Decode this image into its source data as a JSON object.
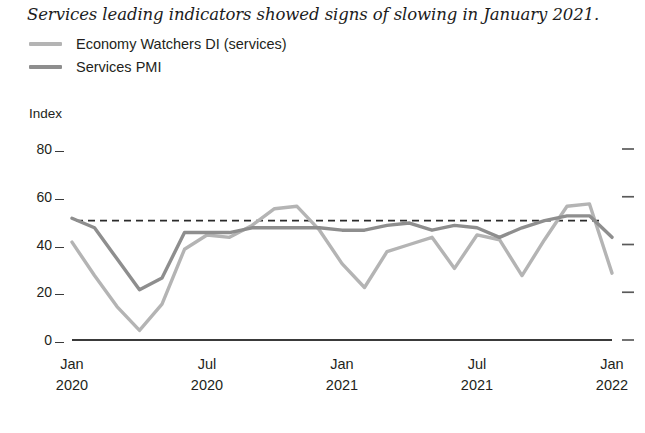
{
  "chart_title": "Services leading indicators showed signs of slowing in January 2021.",
  "axis_unit_label": "Index",
  "legend": {
    "items": [
      {
        "label": "Economy Watchers DI (services)",
        "color": "#b4b4b4",
        "series_key": "economy_watchers_di"
      },
      {
        "label": "Services PMI",
        "color": "#8e8e8e",
        "series_key": "services_pmi"
      }
    ]
  },
  "chart_data": {
    "type": "line",
    "title": "Services leading indicators showed signs of slowing in January 2021.",
    "xlabel": "",
    "ylabel": "Index",
    "ylim": [
      0,
      88
    ],
    "yticks": [
      0,
      20,
      40,
      60,
      80
    ],
    "ytick_labels": [
      "0",
      "20",
      "40",
      "60",
      "80"
    ],
    "grid": false,
    "legend_position": "top-left",
    "right_axis_ticks": [
      0,
      20,
      40,
      60,
      80
    ],
    "reference_line": {
      "value": 50,
      "style": "dashed",
      "color": "#2b2b2b"
    },
    "x": [
      "2020-01",
      "2020-02",
      "2020-03",
      "2020-04",
      "2020-05",
      "2020-06",
      "2020-07",
      "2020-08",
      "2020-09",
      "2020-10",
      "2020-11",
      "2020-12",
      "2021-01",
      "2021-02",
      "2021-03",
      "2021-04",
      "2021-05",
      "2021-06",
      "2021-07",
      "2021-08",
      "2021-09",
      "2021-10",
      "2021-11",
      "2021-12",
      "2022-01"
    ],
    "xtick_positions": [
      "2020-01",
      "2020-07",
      "2021-01",
      "2021-07",
      "2022-01"
    ],
    "xtick_labels": [
      {
        "month": "Jan",
        "year": "2020"
      },
      {
        "month": "Jul",
        "year": "2020"
      },
      {
        "month": "Jan",
        "year": "2021"
      },
      {
        "month": "Jul",
        "year": "2021"
      },
      {
        "month": "Jan",
        "year": "2022"
      }
    ],
    "series": [
      {
        "name": "Economy Watchers DI (services)",
        "color": "#b4b4b4",
        "values": [
          41,
          27,
          14,
          4,
          15,
          38,
          44,
          43,
          48,
          55,
          56,
          46,
          32,
          22,
          37,
          40,
          43,
          30,
          44,
          42,
          27,
          42,
          56,
          57,
          28
        ]
      },
      {
        "name": "Services PMI",
        "color": "#8e8e8e",
        "values": [
          51,
          47,
          34,
          21,
          26,
          45,
          45,
          45,
          47,
          47,
          47,
          47,
          46,
          46,
          48,
          49,
          46,
          48,
          47,
          43,
          47,
          50,
          52,
          52,
          43
        ]
      }
    ]
  },
  "geometry": {
    "plot_left": 72,
    "plot_right": 612,
    "y_zero_px": 340,
    "y_per_unit_px": 2.3875
  }
}
